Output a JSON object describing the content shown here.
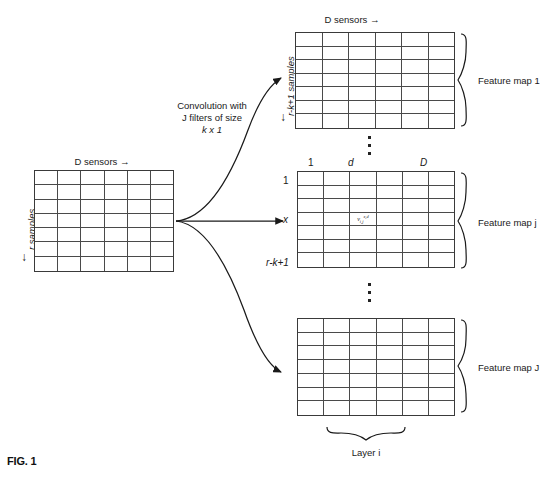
{
  "figure": {
    "caption": "FIG. 1"
  },
  "input_block": {
    "top_label": "D sensors",
    "top_arrow": "→",
    "left_label": "r samples",
    "left_arrow": "↓",
    "columns": 6,
    "rows": 7
  },
  "convolution": {
    "line1": "Convolution with",
    "line2": "J filters of size",
    "line3": "k x 1"
  },
  "feature_maps": [
    {
      "id": "feature-map-1",
      "label": "Feature map 1",
      "top_label": "D sensors",
      "top_arrow": "→",
      "left_label": "r-k+1 samples",
      "left_arrow": "↓",
      "columns": 6,
      "rows": 7
    },
    {
      "id": "feature-map-j",
      "label": "Feature map j",
      "col_labels": [
        "1",
        "d",
        "D"
      ],
      "row_labels": [
        "1",
        "x",
        "r-k+1"
      ],
      "cell_symbol": "v",
      "cell_sub": "i,j",
      "cell_sup": "x,d",
      "columns": 6,
      "rows": 7
    },
    {
      "id": "feature-map-J",
      "label": "Feature map J",
      "columns": 6,
      "rows": 7
    }
  ],
  "layer": {
    "label": "Layer i"
  },
  "ellipsis": {
    "glyph": "▪",
    "count": 3
  },
  "colors": {
    "ink": "#1a1a1a",
    "grid_line": "#4a4a4a",
    "grid_border": "#3a3a3a",
    "background": "#ffffff"
  }
}
